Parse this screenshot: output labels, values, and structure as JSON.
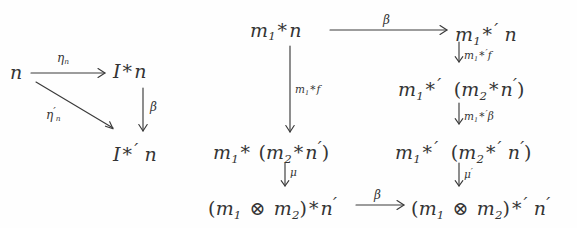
{
  "figure": {
    "kind": "commutative-diagram-pair",
    "background_color": "#fefefe",
    "ink_color": "#343434"
  },
  "left_diagram": {
    "name": "unit-compatibility-triangle",
    "nodes": {
      "source": "n",
      "top_right": "I * n",
      "bottom_right": "I *' n"
    },
    "labels": {
      "top_arrow": "η",
      "top_arrow_sub": "n",
      "diagonal_arrow": "η",
      "diagonal_arrow_prime": "′",
      "diagonal_arrow_sub": "n",
      "vertical_arrow": "β"
    }
  },
  "right_diagram": {
    "name": "associativity-compatibility-square",
    "nodes": {
      "top_left": "m1 * n",
      "top_right": "m1 *' n",
      "mid_left": "m1 * (m2 * n')",
      "mid_right_upper": "m1 *' (m2 * n')",
      "mid_right_lower": "m1 *' (m2 *' n')",
      "bottom_left": "(m1 ⊗ m2) * n'",
      "bottom_right": "(m1 ⊗ m2) *' n'"
    },
    "labels": {
      "top_arrow": "β",
      "bottom_arrow": "β",
      "left_vertical": "m1*f",
      "right_vertical_1": "m1*'f",
      "right_vertical_2": "m1*'β",
      "left_vertical_mu": "μ",
      "right_vertical_mu": "μ'"
    }
  },
  "symbols": {
    "star": "*",
    "prime": "′",
    "tensor": "⊗",
    "beta": "β",
    "eta": "η",
    "mu": "μ",
    "down_arrow": "↓"
  }
}
